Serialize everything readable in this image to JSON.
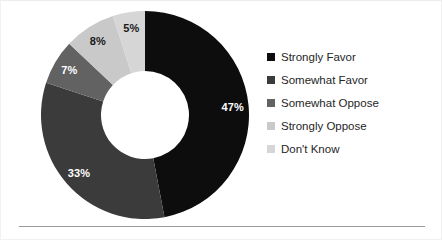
{
  "chart_data": {
    "type": "pie",
    "variant": "donut",
    "title": "",
    "subtitle": "",
    "xlabel": "",
    "ylabel": "",
    "grid": false,
    "legend_position": "right",
    "start_angle_deg": 0,
    "direction": "clockwise",
    "units": "percent",
    "total": 100,
    "categories": [
      "Strongly Favor",
      "Somewhat Favor",
      "Somewhat Oppose",
      "Strongly Oppose",
      "Don't Know"
    ],
    "values": [
      47,
      33,
      7,
      8,
      5
    ],
    "data_labels": [
      "47%",
      "33%",
      "7%",
      "8%",
      "5%"
    ],
    "colors": [
      "#0d0d0d",
      "#3b3b3b",
      "#626262",
      "#c9c9c9",
      "#d6d6d6"
    ],
    "label_colors": [
      "#ffffff",
      "#ffffff",
      "#ffffff",
      "#1a1a1a",
      "#1a1a1a"
    ],
    "slices": [
      {
        "label": "Strongly Favor",
        "value": 47,
        "display": "47%",
        "color": "#0d0d0d",
        "label_color": "#ffffff"
      },
      {
        "label": "Somewhat Favor",
        "value": 33,
        "display": "33%",
        "color": "#3b3b3b",
        "label_color": "#ffffff"
      },
      {
        "label": "Somewhat Oppose",
        "value": 7,
        "display": "7%",
        "color": "#626262",
        "label_color": "#ffffff"
      },
      {
        "label": "Strongly Oppose",
        "value": 8,
        "display": "8%",
        "color": "#c9c9c9",
        "label_color": "#1a1a1a"
      },
      {
        "label": "Don't Know",
        "value": 5,
        "display": "5%",
        "color": "#d6d6d6",
        "label_color": "#1a1a1a"
      }
    ]
  },
  "legend": {
    "items": [
      {
        "label": "Strongly Favor",
        "color": "#0d0d0d"
      },
      {
        "label": "Somewhat Favor",
        "color": "#3b3b3b"
      },
      {
        "label": "Somewhat Oppose",
        "color": "#626262"
      },
      {
        "label": "Strongly Oppose",
        "color": "#c9c9c9"
      },
      {
        "label": "Don't Know",
        "color": "#d6d6d6"
      }
    ]
  },
  "style": {
    "background": "#ffffff",
    "rule_color": "#9a9a9a",
    "border_color": "#f0f0f0"
  }
}
